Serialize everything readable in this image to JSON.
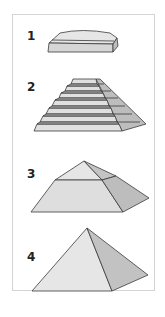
{
  "figure": {
    "title": "",
    "stages": [
      {
        "number": "1",
        "shape": "mastaba-slab"
      },
      {
        "number": "2",
        "shape": "step-pyramid"
      },
      {
        "number": "3",
        "shape": "bent-pyramid"
      },
      {
        "number": "4",
        "shape": "true-pyramid"
      }
    ]
  },
  "colors": {
    "light_face": "#e6e6e6",
    "mid_face": "#d4d4d4",
    "dark_face": "#bdbdbd",
    "edge": "#3a3a3a",
    "frame": "#d4d4d4"
  }
}
